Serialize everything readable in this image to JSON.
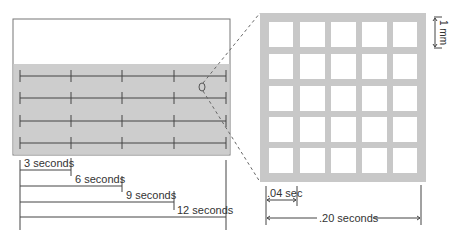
{
  "colors": {
    "strip_fill": "#cdcdcd",
    "strip_border": "#777777",
    "line": "#444444",
    "grid_fill": "#c8c8c8",
    "cell_fill": "#ffffff",
    "dash": "#666666"
  },
  "left_panel": {
    "strip_rows": 4,
    "tick_columns": 5,
    "intervals": [
      {
        "label": "3 seconds"
      },
      {
        "label": "6 seconds"
      },
      {
        "label": "9 seconds"
      },
      {
        "label": "12 seconds"
      }
    ]
  },
  "right_panel": {
    "grid_rows": 5,
    "grid_cols": 5,
    "scale_label": "1 mm",
    "small_interval_label": ".04 sec",
    "large_interval_label": ".20 seconds"
  }
}
